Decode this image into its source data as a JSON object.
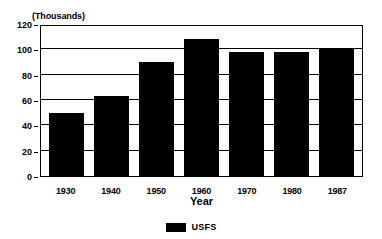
{
  "chart_data": {
    "type": "bar",
    "title": "",
    "units_label": "(Thousands)",
    "categories": [
      "1930",
      "1940",
      "1950",
      "1960",
      "1970",
      "1980",
      "1987"
    ],
    "values": [
      50,
      63,
      90,
      108,
      98,
      98,
      101
    ],
    "series": [
      {
        "name": "USFS",
        "color": "#000000",
        "values": [
          50,
          63,
          90,
          108,
          98,
          98,
          101
        ]
      }
    ],
    "xlabel": "Year",
    "ylabel": "",
    "ylim": [
      0,
      120
    ],
    "yticks": [
      0,
      20,
      40,
      60,
      80,
      100,
      120
    ],
    "ytick_labels": [
      "0",
      "20",
      "40",
      "60",
      "80",
      "100",
      "120"
    ],
    "grid": true,
    "grid_axis": "y",
    "legend": {
      "position": "bottom-center",
      "entries": [
        {
          "label": "USFS",
          "color": "#000000"
        }
      ]
    }
  }
}
